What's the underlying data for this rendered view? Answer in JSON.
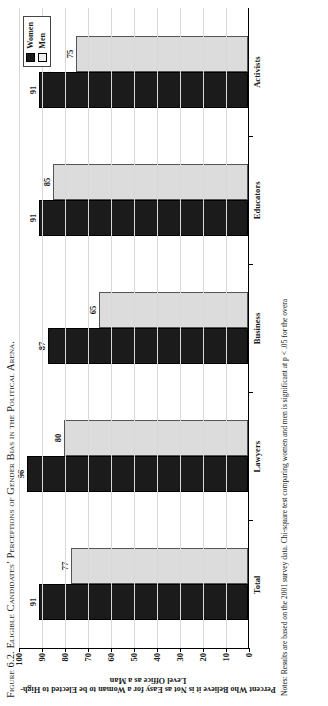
{
  "figure": {
    "title_label": "Figure 6.2.",
    "title_text": "Eligible Candidates’ Perceptions of Gender Bias in the Political Arena.",
    "note": "Notes: Results are based on the 2001 survey data. Chi-square test comparing women and men is significant at p < .05 for the overa"
  },
  "legend": {
    "position": "top-right",
    "entries": [
      {
        "label": "Women",
        "color": "#1b1b1b"
      },
      {
        "label": "Men",
        "color": "#f0f0f0"
      }
    ]
  },
  "chart_data": {
    "type": "bar",
    "title": "Eligible Candidates’ Perceptions of Gender Bias in the Political Arena.",
    "xlabel": "",
    "ylabel": "Percent Who Believe it is Not as Easy for a Woman to be Elected to High-Level Office as a Man",
    "categories": [
      "Total",
      "Lawyers",
      "Business",
      "Educators",
      "Activists"
    ],
    "series": [
      {
        "name": "Women",
        "values": [
          91,
          96,
          87,
          91,
          91
        ]
      },
      {
        "name": "Men",
        "values": [
          77,
          80,
          65,
          85,
          75
        ]
      }
    ],
    "ylim": [
      0,
      100
    ],
    "yticks": [
      100,
      90,
      80,
      70,
      60,
      50,
      40,
      30,
      20,
      10,
      0
    ],
    "grid": true,
    "legend_position": "top-right"
  }
}
